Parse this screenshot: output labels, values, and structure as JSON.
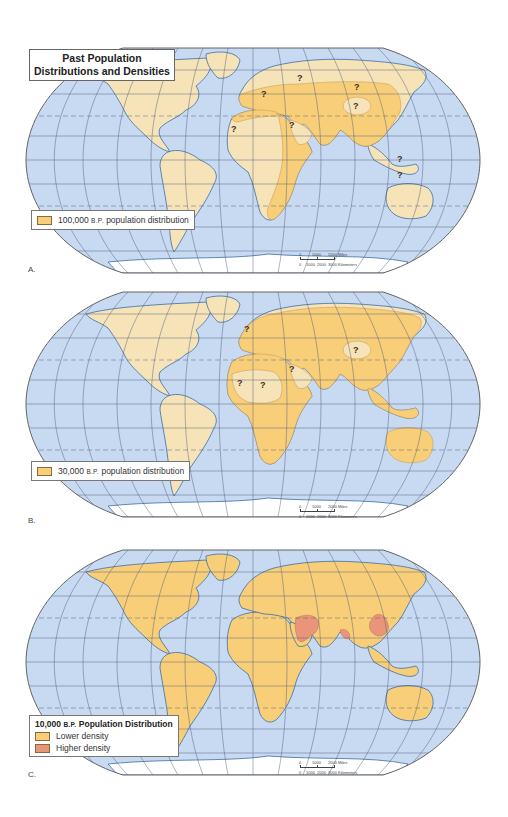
{
  "figure": {
    "title_line1": "Past Population",
    "title_line2": "Distributions and Densities"
  },
  "colors": {
    "ocean": "#c8d9f2",
    "land_uninhabited": "#f6e3b8",
    "population_distribution": "#f8cf78",
    "lower_density": "#f8cf78",
    "higher_density": "#e8957a",
    "coastline": "#3a6ea5",
    "graticule": "#4a5a78"
  },
  "panels": [
    {
      "label": "A.",
      "legend": {
        "number": "100,000",
        "bp": "B.P.",
        "text": "population distribution"
      },
      "uncertain_marker": "?",
      "scale": {
        "miles_ticks": [
          "0",
          "1000",
          "2000 Miles"
        ],
        "km_ticks": [
          "0",
          "1000",
          "2000",
          "3000 Kilometers"
        ]
      }
    },
    {
      "label": "B.",
      "legend": {
        "number": "30,000",
        "bp": "B.P.",
        "text": "population distribution"
      },
      "uncertain_marker": "?",
      "scale": {
        "miles_ticks": [
          "0",
          "1000",
          "2000 Miles"
        ],
        "km_ticks": [
          "0",
          "1000",
          "2000",
          "3000 Kilometers"
        ]
      }
    },
    {
      "label": "C.",
      "legend": {
        "number": "10,000",
        "bp": "B.P.",
        "title_text": "Population Distribution",
        "items": [
          {
            "label": "Lower density"
          },
          {
            "label": "Higher density"
          }
        ]
      },
      "scale": {
        "miles_ticks": [
          "0",
          "1000",
          "2000 Miles"
        ],
        "km_ticks": [
          "0",
          "1000",
          "2000",
          "3000 Kilometers"
        ]
      }
    }
  ]
}
